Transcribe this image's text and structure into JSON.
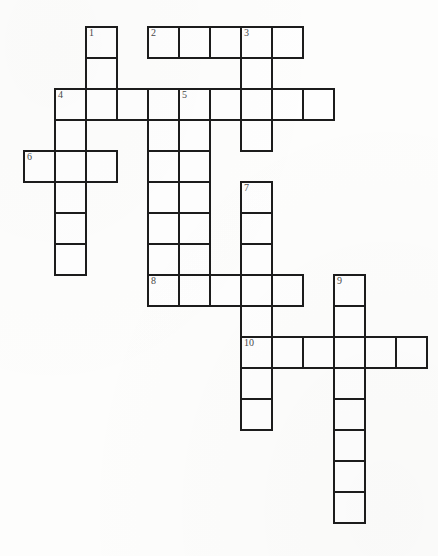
{
  "document": {
    "type": "crossword-puzzle-grid",
    "title": "Crossword Puzzle",
    "background_color": "#fdfdfc",
    "cell_fill_color": "#fefefe",
    "cell_border_color": "#1c1c1c",
    "number_color": "#4a4a4a",
    "cell_size_px": 31,
    "grid_origin": {
      "x": 23,
      "y": 26
    }
  },
  "grid": {
    "columns": 13,
    "rows": 16,
    "cells": [
      {
        "col": 2,
        "row": 0,
        "number": "1"
      },
      {
        "col": 2,
        "row": 1,
        "number": ""
      },
      {
        "col": 2,
        "row": 2,
        "number": ""
      },
      {
        "col": 4,
        "row": 0,
        "number": "2"
      },
      {
        "col": 5,
        "row": 0,
        "number": ""
      },
      {
        "col": 6,
        "row": 0,
        "number": ""
      },
      {
        "col": 7,
        "row": 0,
        "number": "3"
      },
      {
        "col": 8,
        "row": 0,
        "number": ""
      },
      {
        "col": 7,
        "row": 1,
        "number": ""
      },
      {
        "col": 7,
        "row": 2,
        "number": ""
      },
      {
        "col": 7,
        "row": 3,
        "number": ""
      },
      {
        "col": 1,
        "row": 2,
        "number": "4"
      },
      {
        "col": 3,
        "row": 2,
        "number": ""
      },
      {
        "col": 4,
        "row": 2,
        "number": ""
      },
      {
        "col": 5,
        "row": 2,
        "number": "5"
      },
      {
        "col": 6,
        "row": 2,
        "number": ""
      },
      {
        "col": 8,
        "row": 2,
        "number": ""
      },
      {
        "col": 9,
        "row": 2,
        "number": ""
      },
      {
        "col": 1,
        "row": 3,
        "number": ""
      },
      {
        "col": 1,
        "row": 4,
        "number": ""
      },
      {
        "col": 1,
        "row": 5,
        "number": ""
      },
      {
        "col": 1,
        "row": 6,
        "number": ""
      },
      {
        "col": 1,
        "row": 7,
        "number": ""
      },
      {
        "col": 0,
        "row": 4,
        "number": "6"
      },
      {
        "col": 2,
        "row": 4,
        "number": ""
      },
      {
        "col": 5,
        "row": 3,
        "number": ""
      },
      {
        "col": 5,
        "row": 4,
        "number": ""
      },
      {
        "col": 5,
        "row": 5,
        "number": ""
      },
      {
        "col": 5,
        "row": 6,
        "number": ""
      },
      {
        "col": 5,
        "row": 7,
        "number": ""
      },
      {
        "col": 4,
        "row": 3,
        "number": ""
      },
      {
        "col": 4,
        "row": 4,
        "number": ""
      },
      {
        "col": 4,
        "row": 5,
        "number": ""
      },
      {
        "col": 4,
        "row": 6,
        "number": ""
      },
      {
        "col": 4,
        "row": 7,
        "number": ""
      },
      {
        "col": 7,
        "row": 5,
        "number": "7"
      },
      {
        "col": 7,
        "row": 6,
        "number": ""
      },
      {
        "col": 7,
        "row": 7,
        "number": ""
      },
      {
        "col": 4,
        "row": 8,
        "number": "8"
      },
      {
        "col": 5,
        "row": 8,
        "number": ""
      },
      {
        "col": 6,
        "row": 8,
        "number": ""
      },
      {
        "col": 7,
        "row": 8,
        "number": ""
      },
      {
        "col": 8,
        "row": 8,
        "number": ""
      },
      {
        "col": 7,
        "row": 9,
        "number": ""
      },
      {
        "col": 10,
        "row": 8,
        "number": "9"
      },
      {
        "col": 10,
        "row": 9,
        "number": ""
      },
      {
        "col": 7,
        "row": 10,
        "number": "10"
      },
      {
        "col": 8,
        "row": 10,
        "number": ""
      },
      {
        "col": 9,
        "row": 10,
        "number": ""
      },
      {
        "col": 10,
        "row": 10,
        "number": ""
      },
      {
        "col": 11,
        "row": 10,
        "number": ""
      },
      {
        "col": 12,
        "row": 10,
        "number": ""
      },
      {
        "col": 7,
        "row": 11,
        "number": ""
      },
      {
        "col": 7,
        "row": 12,
        "number": ""
      },
      {
        "col": 10,
        "row": 11,
        "number": ""
      },
      {
        "col": 10,
        "row": 12,
        "number": ""
      },
      {
        "col": 10,
        "row": 13,
        "number": ""
      },
      {
        "col": 10,
        "row": 14,
        "number": ""
      },
      {
        "col": 10,
        "row": 15,
        "number": ""
      }
    ]
  },
  "clue_numbers": [
    "1",
    "2",
    "3",
    "4",
    "5",
    "6",
    "7",
    "8",
    "9",
    "10"
  ],
  "entries": {
    "across": [
      {
        "number": "2",
        "start_col": 4,
        "row": 0,
        "length": 5
      },
      {
        "number": "4",
        "start_col": 1,
        "row": 2,
        "length": 9
      },
      {
        "number": "6",
        "start_col": 0,
        "row": 4,
        "length": 3
      },
      {
        "number": "8",
        "start_col": 4,
        "row": 8,
        "length": 5
      },
      {
        "number": "10",
        "start_col": 7,
        "row": 10,
        "length": 6
      }
    ],
    "down": [
      {
        "number": "1",
        "col": 2,
        "start_row": 0,
        "length": 3
      },
      {
        "number": "3",
        "col": 7,
        "start_row": 0,
        "length": 4
      },
      {
        "number": "4",
        "col": 1,
        "start_row": 2,
        "length": 6
      },
      {
        "number": "5",
        "col": 5,
        "start_row": 2,
        "length": 6
      },
      {
        "number": "7",
        "col": 7,
        "start_row": 5,
        "length": 8
      },
      {
        "number": "9",
        "col": 10,
        "start_row": 8,
        "length": 8
      }
    ]
  }
}
